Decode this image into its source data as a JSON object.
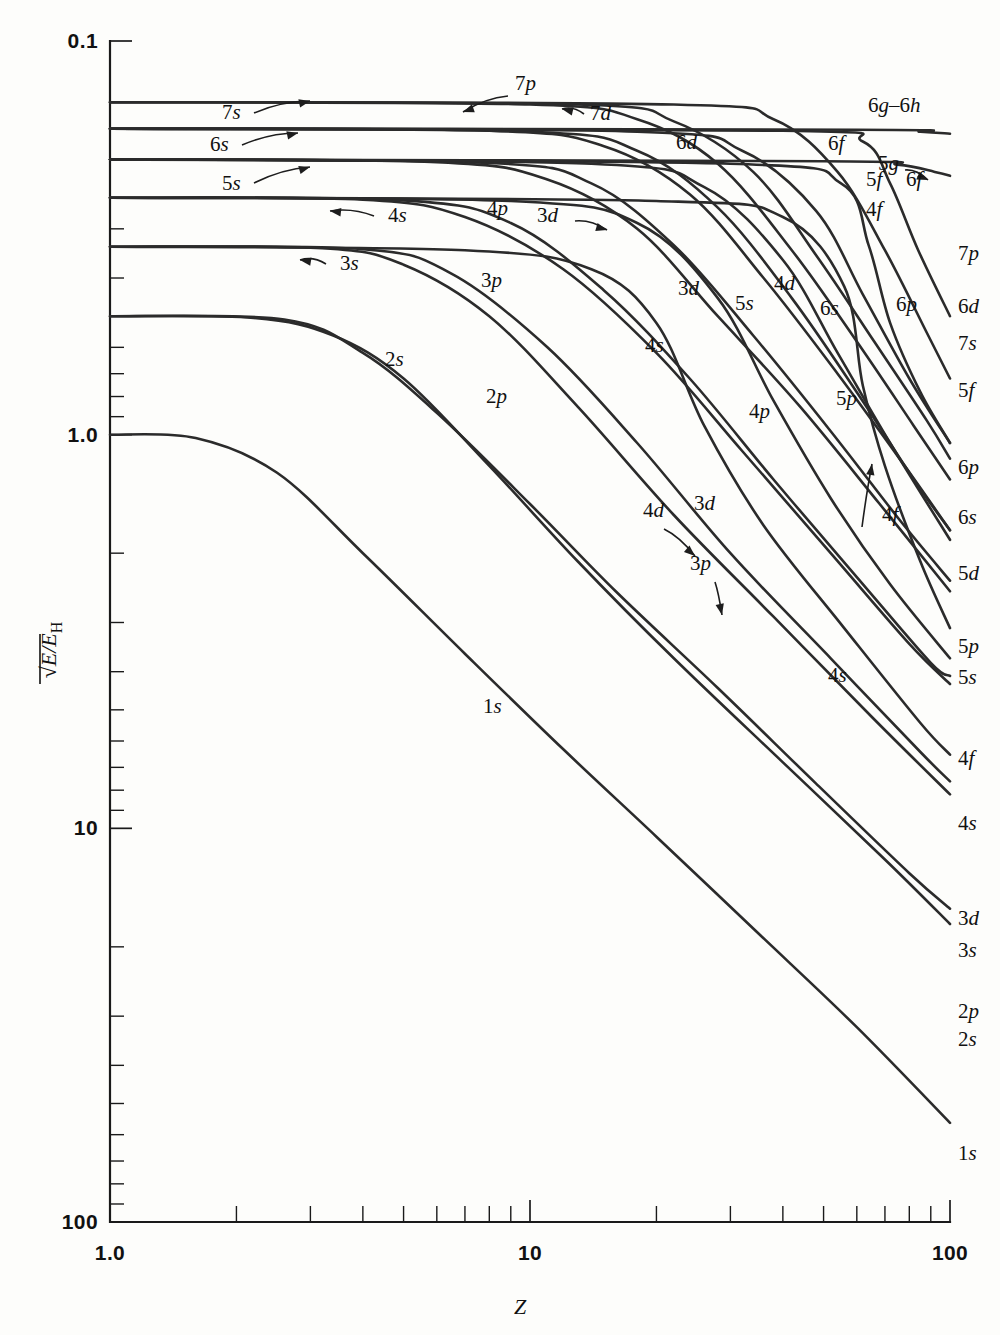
{
  "figure": {
    "background_color": "#fdfdfb",
    "line_color": "#2b2b2b"
  },
  "axes": {
    "x": {
      "title": "Z",
      "scale": "log",
      "range": [
        1.0,
        100
      ],
      "tick_labels": [
        "1.0",
        "10",
        "100"
      ],
      "tick_values": [
        1,
        10,
        100
      ],
      "minor_ticks": [
        2,
        3,
        4,
        5,
        6,
        7,
        8,
        9,
        20,
        30,
        40,
        50,
        60,
        70,
        80,
        90
      ]
    },
    "y": {
      "title_parts": {
        "radical": "√",
        "numerator": "E/E",
        "subscript": "H"
      },
      "title_plain": "√(E/E_H)",
      "scale": "log-inverted",
      "range_top": 0.1,
      "range_bottom": 100,
      "tick_labels": [
        "0.1",
        "1.0",
        "10",
        "100"
      ],
      "tick_values": [
        0.1,
        1.0,
        10,
        100
      ],
      "minor_ticks": [
        0.2,
        0.3,
        0.4,
        0.5,
        0.6,
        0.7,
        0.8,
        0.9,
        2,
        3,
        4,
        5,
        6,
        7,
        8,
        9,
        20,
        30,
        40,
        50,
        60,
        70,
        80,
        90
      ]
    }
  },
  "chart_data": {
    "type": "line",
    "title": "",
    "xlabel": "Z",
    "ylabel": "√(E/E_H)",
    "xlim": [
      1.0,
      100
    ],
    "ylim": [
      0.1,
      100
    ],
    "x_scale": "log",
    "y_scale": "log",
    "y_inverted": true,
    "grid": false,
    "legend": "inline-labels",
    "series": [
      {
        "name": "1s",
        "plateau": 1.0,
        "n": 1,
        "l": "s",
        "points": [
          [
            1.0,
            1.0
          ],
          [
            1.6,
            1.02
          ],
          [
            2.5,
            1.25
          ],
          [
            4,
            2.0
          ],
          [
            7,
            3.6
          ],
          [
            12,
            6.3
          ],
          [
            20,
            10.5
          ],
          [
            35,
            18.5
          ],
          [
            60,
            32
          ],
          [
            100,
            56
          ]
        ]
      },
      {
        "name": "2s",
        "plateau": 0.5,
        "n": 2,
        "l": "s",
        "points": [
          [
            1.0,
            0.5
          ],
          [
            2.2,
            0.505
          ],
          [
            3.4,
            0.56
          ],
          [
            5,
            0.72
          ],
          [
            8,
            1.2
          ],
          [
            13,
            2.1
          ],
          [
            22,
            3.7
          ],
          [
            40,
            6.8
          ],
          [
            70,
            12
          ],
          [
            100,
            17.5
          ]
        ]
      },
      {
        "name": "2p",
        "plateau": 0.5,
        "n": 2,
        "l": "p",
        "points": [
          [
            1.0,
            0.5
          ],
          [
            2.6,
            0.51
          ],
          [
            4,
            0.62
          ],
          [
            6,
            0.88
          ],
          [
            10,
            1.5
          ],
          [
            16,
            2.5
          ],
          [
            28,
            4.4
          ],
          [
            48,
            7.7
          ],
          [
            80,
            13
          ],
          [
            100,
            16
          ]
        ]
      },
      {
        "name": "3s",
        "plateau": 0.3333,
        "n": 3,
        "l": "s",
        "points": [
          [
            1.0,
            0.333
          ],
          [
            3.2,
            0.336
          ],
          [
            5,
            0.37
          ],
          [
            8,
            0.5
          ],
          [
            13,
            0.85
          ],
          [
            22,
            1.6
          ],
          [
            38,
            2.9
          ],
          [
            65,
            5.2
          ],
          [
            100,
            8.2
          ]
        ]
      },
      {
        "name": "3p",
        "plateau": 0.3333,
        "n": 3,
        "l": "p",
        "points": [
          [
            1.0,
            0.333
          ],
          [
            4,
            0.338
          ],
          [
            6.5,
            0.39
          ],
          [
            11,
            0.6
          ],
          [
            18,
            1.05
          ],
          [
            30,
            2.0
          ],
          [
            52,
            3.7
          ],
          [
            85,
            6.4
          ],
          [
            100,
            7.6
          ]
        ]
      },
      {
        "name": "3d",
        "plateau": 0.3333,
        "n": 3,
        "l": "d",
        "points": [
          [
            1.0,
            0.333
          ],
          [
            7,
            0.34
          ],
          [
            14,
            0.38
          ],
          [
            20,
            0.52
          ],
          [
            26,
            0.95
          ],
          [
            36,
            1.7
          ],
          [
            56,
            3.1
          ],
          [
            85,
            5.4
          ],
          [
            100,
            6.5
          ]
        ]
      },
      {
        "name": "4s",
        "plateau": 0.25,
        "n": 4,
        "l": "s",
        "points": [
          [
            1.0,
            0.25
          ],
          [
            4,
            0.253
          ],
          [
            7,
            0.28
          ],
          [
            12,
            0.38
          ],
          [
            20,
            0.62
          ],
          [
            32,
            1.1
          ],
          [
            52,
            2.0
          ],
          [
            80,
            3.4
          ],
          [
            100,
            4.3
          ]
        ]
      },
      {
        "name": "4p",
        "plateau": 0.25,
        "n": 4,
        "l": "p",
        "points": [
          [
            1.0,
            0.25
          ],
          [
            5,
            0.254
          ],
          [
            9,
            0.29
          ],
          [
            15,
            0.43
          ],
          [
            24,
            0.72
          ],
          [
            38,
            1.3
          ],
          [
            60,
            2.3
          ],
          [
            90,
            3.8
          ],
          [
            100,
            4.1
          ]
        ]
      },
      {
        "name": "4d",
        "plateau": 0.25,
        "n": 4,
        "l": "d",
        "points": [
          [
            1.0,
            0.25
          ],
          [
            9,
            0.255
          ],
          [
            18,
            0.29
          ],
          [
            28,
            0.45
          ],
          [
            38,
            0.82
          ],
          [
            52,
            1.45
          ],
          [
            72,
            2.4
          ],
          [
            100,
            3.7
          ]
        ]
      },
      {
        "name": "4f",
        "plateau": 0.25,
        "n": 4,
        "l": "f",
        "points": [
          [
            1.0,
            0.25
          ],
          [
            20,
            0.255
          ],
          [
            40,
            0.28
          ],
          [
            56,
            0.42
          ],
          [
            62,
            0.75
          ],
          [
            70,
            1.2
          ],
          [
            85,
            2.1
          ],
          [
            100,
            3.1
          ]
        ]
      },
      {
        "name": "5s",
        "plateau": 0.2,
        "n": 5,
        "l": "s",
        "points": [
          [
            1.0,
            0.2
          ],
          [
            6,
            0.203
          ],
          [
            11,
            0.225
          ],
          [
            18,
            0.3
          ],
          [
            28,
            0.5
          ],
          [
            44,
            0.85
          ],
          [
            68,
            1.5
          ],
          [
            100,
            2.5
          ]
        ]
      },
      {
        "name": "5p",
        "plateau": 0.2,
        "n": 5,
        "l": "p",
        "points": [
          [
            1.0,
            0.2
          ],
          [
            8,
            0.204
          ],
          [
            14,
            0.23
          ],
          [
            22,
            0.33
          ],
          [
            34,
            0.56
          ],
          [
            52,
            0.98
          ],
          [
            76,
            1.65
          ],
          [
            100,
            2.35
          ]
        ]
      },
      {
        "name": "5d",
        "plateau": 0.2,
        "n": 5,
        "l": "d",
        "points": [
          [
            1.0,
            0.2
          ],
          [
            14,
            0.205
          ],
          [
            26,
            0.235
          ],
          [
            40,
            0.36
          ],
          [
            54,
            0.62
          ],
          [
            72,
            1.05
          ],
          [
            100,
            1.85
          ]
        ]
      },
      {
        "name": "5f",
        "plateau": 0.2,
        "n": 5,
        "l": "f",
        "points": [
          [
            1.0,
            0.2
          ],
          [
            30,
            0.205
          ],
          [
            55,
            0.23
          ],
          [
            64,
            0.33
          ],
          [
            72,
            0.52
          ],
          [
            85,
            0.78
          ],
          [
            100,
            1.05
          ]
        ]
      },
      {
        "name": "5g",
        "plateau": 0.2,
        "n": 5,
        "l": "g",
        "points": [
          [
            1.0,
            0.2
          ],
          [
            50,
            0.202
          ],
          [
            75,
            0.206
          ],
          [
            92,
            0.215
          ],
          [
            100,
            0.22
          ]
        ]
      },
      {
        "name": "6s",
        "plateau": 0.1667,
        "n": 6,
        "l": "s",
        "points": [
          [
            1.0,
            0.167
          ],
          [
            8,
            0.169
          ],
          [
            15,
            0.185
          ],
          [
            24,
            0.245
          ],
          [
            36,
            0.4
          ],
          [
            54,
            0.7
          ],
          [
            78,
            1.2
          ],
          [
            100,
            1.75
          ]
        ]
      },
      {
        "name": "6p",
        "plateau": 0.1667,
        "n": 6,
        "l": "p",
        "points": [
          [
            1.0,
            0.167
          ],
          [
            10,
            0.17
          ],
          [
            18,
            0.19
          ],
          [
            28,
            0.265
          ],
          [
            42,
            0.45
          ],
          [
            60,
            0.78
          ],
          [
            82,
            1.3
          ],
          [
            100,
            1.75
          ]
        ]
      },
      {
        "name": "6d",
        "plateau": 0.1667,
        "n": 6,
        "l": "d",
        "points": [
          [
            1.0,
            0.167
          ],
          [
            18,
            0.17
          ],
          [
            32,
            0.19
          ],
          [
            48,
            0.27
          ],
          [
            62,
            0.44
          ],
          [
            80,
            0.72
          ],
          [
            100,
            1.05
          ]
        ]
      },
      {
        "name": "6f",
        "plateau": 0.1667,
        "n": 6,
        "l": "f",
        "points": [
          [
            1.0,
            0.167
          ],
          [
            40,
            0.169
          ],
          [
            62,
            0.18
          ],
          [
            72,
            0.23
          ],
          [
            84,
            0.34
          ],
          [
            100,
            0.5
          ]
        ]
      },
      {
        "name": "6g–6h",
        "plateau": 0.1667,
        "n": 6,
        "l": "g-h",
        "points": [
          [
            1.0,
            0.167
          ],
          [
            60,
            0.168
          ],
          [
            85,
            0.17
          ],
          [
            100,
            0.172
          ]
        ]
      },
      {
        "name": "7s",
        "plateau": 0.1429,
        "n": 7,
        "l": "s",
        "points": [
          [
            1.0,
            0.143
          ],
          [
            10,
            0.145
          ],
          [
            18,
            0.158
          ],
          [
            28,
            0.205
          ],
          [
            42,
            0.34
          ],
          [
            60,
            0.58
          ],
          [
            82,
            0.95
          ],
          [
            100,
            1.3
          ]
        ]
      },
      {
        "name": "7p",
        "plateau": 0.1429,
        "n": 7,
        "l": "p",
        "points": [
          [
            1.0,
            0.143
          ],
          [
            13,
            0.145
          ],
          [
            22,
            0.16
          ],
          [
            34,
            0.215
          ],
          [
            48,
            0.35
          ],
          [
            66,
            0.58
          ],
          [
            88,
            0.92
          ],
          [
            100,
            1.15
          ]
        ]
      },
      {
        "name": "7d",
        "plateau": 0.1429,
        "n": 7,
        "l": "d",
        "points": [
          [
            1.0,
            0.143
          ],
          [
            22,
            0.145
          ],
          [
            38,
            0.158
          ],
          [
            54,
            0.215
          ],
          [
            70,
            0.34
          ],
          [
            88,
            0.55
          ],
          [
            100,
            0.72
          ]
        ]
      }
    ]
  },
  "labels": {
    "left_annotations": [
      {
        "text": "7s",
        "kind": "arrow-right"
      },
      {
        "text": "6s",
        "kind": "arrow-right"
      },
      {
        "text": "5s",
        "kind": "arrow-right"
      },
      {
        "text": "4s",
        "kind": "arrow-left"
      },
      {
        "text": "3s",
        "kind": "arrow-left"
      }
    ],
    "inline": [
      {
        "text": "7p"
      },
      {
        "text": "7d"
      },
      {
        "text": "6d"
      },
      {
        "text": "6f"
      },
      {
        "text": "5g"
      },
      {
        "text": "5f"
      },
      {
        "text": "6f"
      },
      {
        "text": "4f"
      },
      {
        "text": "6g–6h"
      },
      {
        "text": "4p"
      },
      {
        "text": "3d"
      },
      {
        "text": "3p"
      },
      {
        "text": "2s"
      },
      {
        "text": "2p"
      },
      {
        "text": "1s"
      },
      {
        "text": "4s"
      },
      {
        "text": "3d"
      },
      {
        "text": "4d"
      },
      {
        "text": "5s"
      },
      {
        "text": "6s"
      },
      {
        "text": "5p"
      },
      {
        "text": "4p"
      },
      {
        "text": "6p"
      },
      {
        "text": "4d"
      },
      {
        "text": "3d"
      },
      {
        "text": "3p"
      },
      {
        "text": "4s"
      },
      {
        "text": "4f"
      }
    ],
    "right_edge": [
      {
        "text": "6g–6h"
      },
      {
        "text": "5g"
      },
      {
        "text": "6f"
      },
      {
        "text": "7p"
      },
      {
        "text": "6d"
      },
      {
        "text": "7s"
      },
      {
        "text": "5f"
      },
      {
        "text": "6p"
      },
      {
        "text": "6s"
      },
      {
        "text": "5d"
      },
      {
        "text": "5p"
      },
      {
        "text": "5s"
      },
      {
        "text": "4f"
      },
      {
        "text": "4s"
      },
      {
        "text": "3d"
      },
      {
        "text": "3s"
      },
      {
        "text": "2p"
      },
      {
        "text": "2s"
      },
      {
        "text": "1s"
      }
    ]
  }
}
